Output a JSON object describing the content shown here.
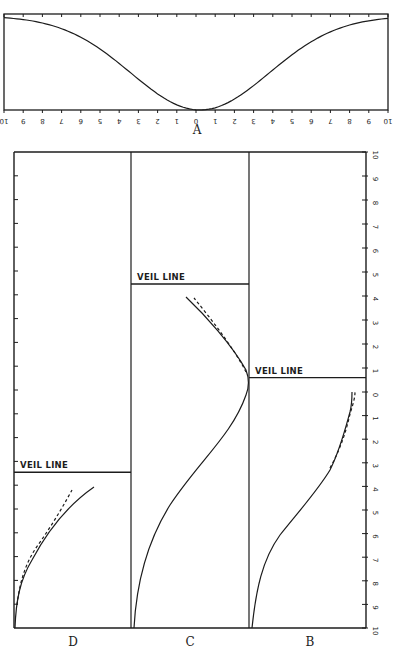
{
  "figure": {
    "panels": {
      "A": {
        "label": "A"
      },
      "B": {
        "label": "B",
        "veil_label": "VEIL LINE",
        "veil_level": 0.6
      },
      "C": {
        "label": "C",
        "veil_label": "VEIL LINE",
        "veil_level": 4.5
      },
      "D": {
        "label": "D",
        "veil_label": "VEIL LINE",
        "veil_level": -3.4
      }
    },
    "axis_a_ticks": [
      "10",
      "9",
      "8",
      "7",
      "6",
      "5",
      "4",
      "3",
      "2",
      "1",
      "0",
      "1",
      "2",
      "3",
      "4",
      "5",
      "6",
      "7",
      "8",
      "9",
      "10"
    ],
    "axis_right_upper_ticks": [
      "10",
      "9",
      "8",
      "7",
      "6",
      "5",
      "4",
      "3",
      "2",
      "1",
      "0"
    ],
    "axis_right_lower_ticks": [
      "1",
      "2",
      "3",
      "4",
      "5",
      "6",
      "7",
      "8",
      "9",
      "10"
    ]
  }
}
